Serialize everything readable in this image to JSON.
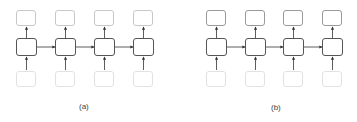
{
  "panels": [
    {
      "id": "a",
      "caption": "(a)",
      "columns": 4,
      "top_style": "light",
      "layout": {
        "x0": 16,
        "pitch": 39
      }
    },
    {
      "id": "b",
      "caption": "(b)",
      "columns": 4,
      "top_style": "dark",
      "layout": {
        "x0": 206,
        "pitch": 38.5
      }
    }
  ],
  "colors": {
    "node_border_middle": "#555555",
    "node_border_top_a": "#c8c8c8",
    "node_border_top_b": "#9a9a9a",
    "node_border_bottom": "#e2e2e2",
    "arrow": "#333333"
  }
}
